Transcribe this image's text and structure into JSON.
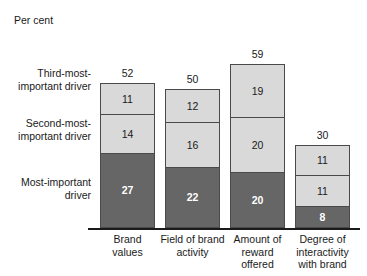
{
  "chart_data": {
    "type": "bar",
    "title": "Per cent",
    "xlabel": "",
    "ylabel": "Per cent",
    "stacked": true,
    "grid": false,
    "legend_position": "left-row-labels",
    "ylim": [
      0,
      59
    ],
    "categories": [
      "Brand\nvalues",
      "Field of brand\nactivity",
      "Amount of\nreward\noffered",
      "Degree of\ninteractivity\nwith brand"
    ],
    "series": [
      {
        "name": "Most-important\ndriver",
        "values": [
          27,
          22,
          20,
          8
        ],
        "color": "#666666"
      },
      {
        "name": "Second-most-\nimportant driver",
        "values": [
          14,
          16,
          20,
          11
        ],
        "color": "#d9d9d9"
      },
      {
        "name": "Third-most-\nimportant driver",
        "values": [
          11,
          12,
          19,
          11
        ],
        "color": "#d9d9d9"
      }
    ],
    "totals": [
      52,
      50,
      59,
      30
    ]
  },
  "colors": {
    "dark_segment": "#666666",
    "light_segment": "#d9d9d9",
    "segment_border": "#4a4a4a",
    "axis": "#1a1a1a",
    "background": "#ffffff"
  }
}
